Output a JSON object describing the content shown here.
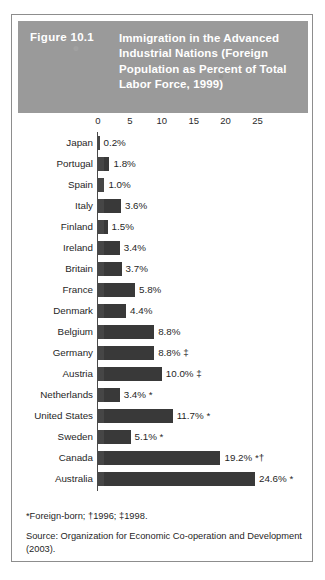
{
  "figure": {
    "number": "Figure 10.1",
    "title": "Immigration in the Advanced Industrial Nations (Foreign Population as Percent of Total Labor Force, 1999)"
  },
  "footnotes": {
    "symbols": "*Foreign-born;   †1996;   ‡1998.",
    "source": "Source: Organization for Economic Co-operation and Development (2003)."
  },
  "chart_data": {
    "type": "bar",
    "orientation": "horizontal",
    "title": "Immigration in the Advanced Industrial Nations (Foreign Population as Percent of Total Labor Force, 1999)",
    "xlabel": "",
    "ylabel": "",
    "xlim": [
      0,
      27
    ],
    "xticks": [
      "0",
      "5",
      "10",
      "15",
      "20",
      "25"
    ],
    "xtick_values": [
      0,
      5,
      10,
      15,
      20,
      25
    ],
    "grid": false,
    "legend": null,
    "categories": [
      "Japan",
      "Portugal",
      "Spain",
      "Italy",
      "Finland",
      "Ireland",
      "Britain",
      "France",
      "Denmark",
      "Belgium",
      "Germany",
      "Austria",
      "Netherlands",
      "United States",
      "Sweden",
      "Canada",
      "Australia"
    ],
    "values": [
      0.2,
      1.8,
      1.0,
      3.6,
      1.5,
      3.4,
      3.7,
      5.8,
      4.4,
      8.8,
      8.8,
      10.0,
      3.4,
      11.7,
      5.1,
      19.2,
      24.6
    ],
    "labels": [
      "0.2%",
      "1.8%",
      "1.0%",
      "3.6%",
      "1.5%",
      "3.4%",
      "3.7%",
      "5.8%",
      "4.4%",
      "8.8%",
      "8.8% ‡",
      "10.0% ‡",
      "3.4% *",
      "11.7% *",
      "5.1% *",
      "19.2% *†",
      "24.6% *"
    ],
    "rows": [
      {
        "name": "Japan",
        "value": 0.2,
        "label": "0.2%"
      },
      {
        "name": "Portugal",
        "value": 1.8,
        "label": "1.8%"
      },
      {
        "name": "Spain",
        "value": 1.0,
        "label": "1.0%"
      },
      {
        "name": "Italy",
        "value": 3.6,
        "label": "3.6%"
      },
      {
        "name": "Finland",
        "value": 1.5,
        "label": "1.5%"
      },
      {
        "name": "Ireland",
        "value": 3.4,
        "label": "3.4%"
      },
      {
        "name": "Britain",
        "value": 3.7,
        "label": "3.7%"
      },
      {
        "name": "France",
        "value": 5.8,
        "label": "5.8%"
      },
      {
        "name": "Denmark",
        "value": 4.4,
        "label": "4.4%"
      },
      {
        "name": "Belgium",
        "value": 8.8,
        "label": "8.8%"
      },
      {
        "name": "Germany",
        "value": 8.8,
        "label": "8.8% ‡"
      },
      {
        "name": "Austria",
        "value": 10.0,
        "label": "10.0% ‡"
      },
      {
        "name": "Netherlands",
        "value": 3.4,
        "label": "3.4% *"
      },
      {
        "name": "United States",
        "value": 11.7,
        "label": "11.7% *"
      },
      {
        "name": "Sweden",
        "value": 5.1,
        "label": "5.1% *"
      },
      {
        "name": "Canada",
        "value": 19.2,
        "label": "19.2% *†"
      },
      {
        "name": "Australia",
        "value": 24.6,
        "label": "24.6% *"
      }
    ]
  },
  "colors": {
    "header_band": "#9a9a9a",
    "bar": "#3c3c3c",
    "border": "#8d8d8d",
    "text": "#1f1f1f",
    "header_text": "#ffffff"
  }
}
